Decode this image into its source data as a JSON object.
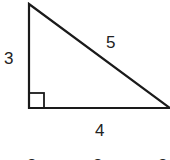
{
  "diagram": {
    "type": "right-triangle",
    "stroke_color": "#1a1a1a",
    "vertices": {
      "top": [
        29,
        4
      ],
      "right_angle": [
        29,
        108
      ],
      "right": [
        170,
        108
      ]
    },
    "sides": {
      "vertical_leg": "3",
      "hypotenuse": "5",
      "horizontal_leg": "4"
    },
    "right_angle_marker": true,
    "bottom_row_partial": [
      "3",
      "3",
      "3"
    ]
  }
}
